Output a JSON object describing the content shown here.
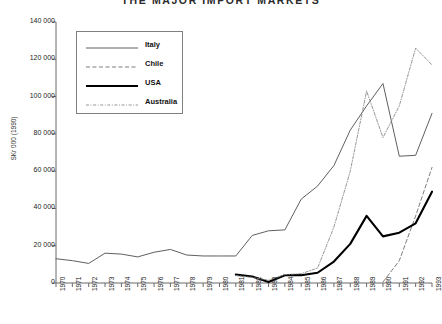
{
  "chart_data": {
    "type": "line",
    "title": "THE MAJOR IMPORT MARKETS",
    "xlabel": "",
    "ylabel": "SKr 000 (1990)",
    "xlim": [
      1970,
      1993
    ],
    "ylim": [
      0,
      140000
    ],
    "ytick_step": 20000,
    "grid": false,
    "legend_position": "upper left",
    "x": [
      1970,
      1971,
      1972,
      1973,
      1974,
      1975,
      1976,
      1977,
      1978,
      1979,
      1980,
      1981,
      1982,
      1983,
      1984,
      1985,
      1986,
      1987,
      1988,
      1989,
      1990,
      1991,
      1992,
      1993
    ],
    "categories": [
      "1970",
      "1971",
      "1972",
      "1973",
      "1974",
      "1975",
      "1976",
      "1977",
      "1978",
      "1979",
      "1980",
      "1981",
      "1982",
      "1983",
      "1984",
      "1985",
      "1986",
      "1987",
      "1988",
      "1989",
      "1990",
      "1991",
      "1992",
      "1993"
    ],
    "ytick_labels": [
      "0",
      "20 000",
      "40 000",
      "60 000",
      "80 000",
      "100 000",
      "120 000",
      "140 000"
    ],
    "ytick_values": [
      0,
      20000,
      40000,
      60000,
      80000,
      100000,
      120000,
      140000
    ],
    "series": [
      {
        "name": "Italy",
        "style": "solid",
        "width": 0.9,
        "color": "#4d4d4d",
        "x": [
          1970,
          1971,
          1972,
          1973,
          1974,
          1975,
          1976,
          1977,
          1978,
          1979,
          1980,
          1981,
          1982,
          1983,
          1984,
          1985,
          1986,
          1987,
          1988,
          1989,
          1990,
          1991,
          1992,
          1993
        ],
        "values": [
          13000,
          12000,
          10500,
          16000,
          15500,
          14000,
          16500,
          18000,
          15000,
          14500,
          14500,
          14500,
          25500,
          28000,
          28500,
          45000,
          52000,
          63000,
          82000,
          95000,
          107000,
          68000,
          68500,
          91000
        ]
      },
      {
        "name": "Chile",
        "style": "dashed",
        "width": 0.9,
        "color": "#6e6e6e",
        "x": [
          1990,
          1991,
          1992,
          1993
        ],
        "values": [
          500,
          12000,
          36000,
          62000
        ]
      },
      {
        "name": "USA",
        "style": "solid",
        "width": 2.1,
        "color": "#000000",
        "x": [
          1981,
          1982,
          1983,
          1984,
          1985,
          1986,
          1987,
          1988,
          1989,
          1990,
          1991,
          1992,
          1993
        ],
        "values": [
          4500,
          3500,
          500,
          4200,
          4200,
          5500,
          11500,
          21000,
          36000,
          25000,
          27000,
          32000,
          49000
        ]
      },
      {
        "name": "Australia",
        "style": "dashdot",
        "width": 0.9,
        "color": "#8a8a8a",
        "x": [
          1981,
          1982,
          1983,
          1984,
          1985,
          1986,
          1987,
          1988,
          1989,
          1990,
          1991,
          1992,
          1993
        ],
        "values": [
          4000,
          3000,
          1500,
          4500,
          5000,
          8000,
          30000,
          60000,
          103000,
          78000,
          95000,
          126000,
          117000
        ]
      }
    ]
  },
  "legend": {
    "entries": [
      {
        "label": "Italy"
      },
      {
        "label": "Chile"
      },
      {
        "label": "USA"
      },
      {
        "label": "Australia"
      }
    ]
  },
  "axes": {
    "y_title": "SKr 000 (1990)"
  }
}
